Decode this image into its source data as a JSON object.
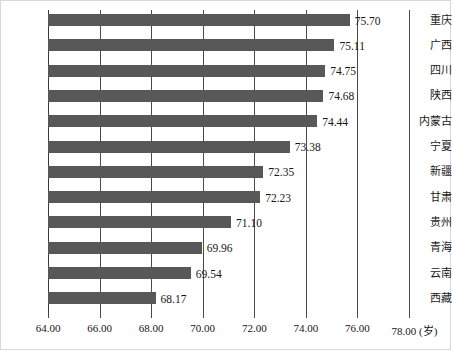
{
  "chart_data": {
    "type": "bar",
    "orientation": "horizontal",
    "title": "",
    "subtitle": "",
    "xlabel": "(岁)",
    "ylabel": "",
    "categories": [
      "重庆",
      "广西",
      "四川",
      "陕西",
      "内蒙古",
      "宁夏",
      "新疆",
      "甘肃",
      "贵州",
      "青海",
      "云南",
      "西藏"
    ],
    "values": [
      75.7,
      75.11,
      74.75,
      74.68,
      74.44,
      73.38,
      72.35,
      72.23,
      71.1,
      69.96,
      69.54,
      68.17
    ],
    "value_labels": [
      "75.70",
      "75.11",
      "74.75",
      "74.68",
      "74.44",
      "73.38",
      "72.35",
      "72.23",
      "71.10",
      "69.96",
      "69.54",
      "68.17"
    ],
    "xlim": [
      64.0,
      78.0
    ],
    "xticks": [
      64.0,
      66.0,
      68.0,
      70.0,
      72.0,
      74.0,
      76.0,
      78.0
    ],
    "xtick_labels": [
      "64.00",
      "66.00",
      "68.00",
      "70.00",
      "72.00",
      "74.00",
      "76.00",
      "78.00 (岁)"
    ],
    "grid": true,
    "grid_axis": "x",
    "legend": false,
    "bar_color": "#585858",
    "grid_color": "#4a4a4a",
    "background_color": "#ffffff",
    "text_color": "#161616"
  }
}
